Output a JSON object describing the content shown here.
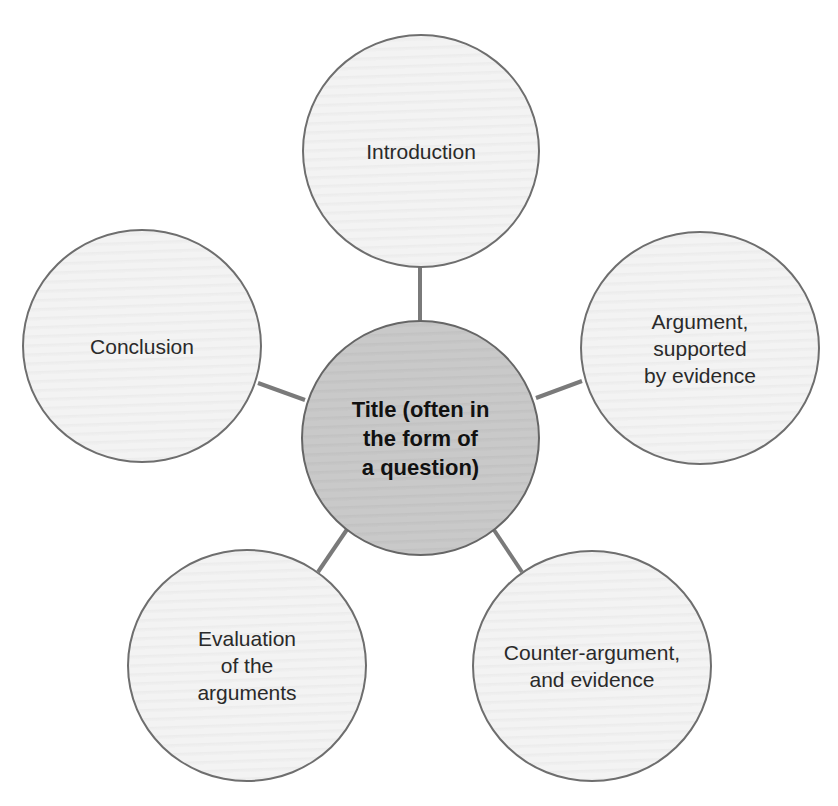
{
  "diagram": {
    "type": "spider",
    "center": {
      "label": "Title (often in\nthe form of\na question)",
      "fill": "#c8c8c8"
    },
    "nodes": [
      {
        "id": "introduction",
        "label": "Introduction"
      },
      {
        "id": "argument",
        "label": "Argument,\nsupported\nby evidence"
      },
      {
        "id": "counter-argument",
        "label": "Counter-argument,\nand evidence"
      },
      {
        "id": "evaluation",
        "label": "Evaluation\nof the\narguments"
      },
      {
        "id": "conclusion",
        "label": "Conclusion"
      }
    ],
    "colors": {
      "outer_fill": "#f1f1f1",
      "border": "#6e6e6e",
      "connector": "#7a7a7a"
    }
  }
}
